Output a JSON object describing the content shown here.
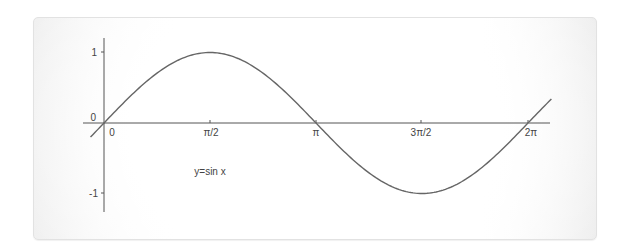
{
  "chart_data": {
    "type": "line",
    "title": "",
    "xlabel": "",
    "ylabel": "",
    "annotation": "y=sin x",
    "x_tick_labels": [
      "0",
      "π/2",
      "π",
      "3π/2",
      "2π"
    ],
    "x_tick_values": [
      0,
      1.5708,
      3.1416,
      4.7124,
      6.2832
    ],
    "y_tick_labels": [
      "1",
      "0",
      "-1"
    ],
    "y_tick_values": [
      1,
      0,
      -1
    ],
    "xlim": [
      -0.2,
      6.65
    ],
    "ylim": [
      -1.15,
      1.2
    ],
    "grid": false,
    "legend": null,
    "series": [
      {
        "name": "y=sin x",
        "color": "#666666",
        "x": [
          -0.2,
          0,
          0.5236,
          1.0472,
          1.5708,
          2.0944,
          2.618,
          3.1416,
          3.6652,
          4.1888,
          4.7124,
          5.236,
          5.7596,
          6.2832,
          6.63
        ],
        "y": [
          -0.199,
          0,
          0.5,
          0.866,
          1,
          0.866,
          0.5,
          0,
          -0.5,
          -0.866,
          -1,
          -0.866,
          -0.5,
          0,
          0.34
        ]
      }
    ]
  },
  "axes": {
    "axis_color": "#555555",
    "curve_color": "#666666",
    "origin_label_y": "0"
  }
}
